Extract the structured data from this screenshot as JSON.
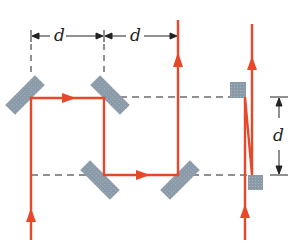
{
  "diagram": {
    "labels": {
      "top_left_d": "d",
      "top_right_d": "d",
      "side_d": "d"
    },
    "colors": {
      "beam": "#e8482a",
      "mirror": "#8a9aa8",
      "dash": "#222222",
      "dimension": "#222222"
    },
    "elements": [
      "left beam path with two 45-degree mirrors (periscope offset)",
      "two right-angle mirror pairs separated horizontally by d",
      "right-side pair of small square mirrors separated vertically by d"
    ]
  }
}
